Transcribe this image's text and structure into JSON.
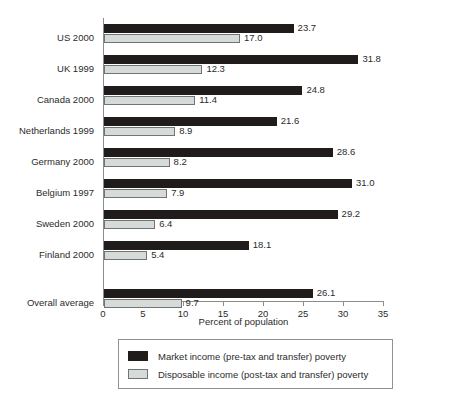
{
  "chart_data": {
    "type": "bar",
    "orientation": "horizontal",
    "title": "",
    "xlabel": "Percent of population",
    "ylabel": "",
    "xlim": [
      0,
      35
    ],
    "xticks": [
      0,
      5,
      10,
      15,
      20,
      25,
      30,
      35
    ],
    "xtick_labels": [
      "0",
      "5",
      "10",
      "15",
      "20",
      "25",
      "30",
      "35"
    ],
    "grid": false,
    "legend_position": "bottom",
    "categories": [
      "US 2000",
      "UK 1999",
      "Canada 2000",
      "Netherlands 1999",
      "Germany 2000",
      "Belgium 1997",
      "Sweden 2000",
      "Finland 2000",
      "Overall average"
    ],
    "series": [
      {
        "name": "Market income (pre-tax and transfer) poverty",
        "color": "#201c1b",
        "values": [
          23.7,
          31.8,
          24.8,
          21.6,
          28.6,
          31.0,
          29.2,
          18.1,
          26.1
        ],
        "labels": [
          "23.7",
          "31.8",
          "24.8",
          "21.6",
          "28.6",
          "31.0",
          "29.2",
          "18.1",
          "26.1"
        ]
      },
      {
        "name": "Disposable income (post-tax and transfer) poverty",
        "color": "#d6dad9",
        "values": [
          17.0,
          12.3,
          11.4,
          8.9,
          8.2,
          7.9,
          6.4,
          5.4,
          9.7
        ],
        "labels": [
          "17.0",
          "12.3",
          "11.4",
          "8.9",
          "8.2",
          "7.9",
          "6.4",
          "5.4",
          "9.7"
        ]
      }
    ]
  },
  "axis": {
    "x_title": "Percent of population"
  },
  "legend": {
    "items": [
      {
        "label": "Market income (pre-tax and transfer) poverty",
        "swatch": "market"
      },
      {
        "label": "Disposable income (post-tax and transfer) poverty",
        "swatch": "disposable"
      }
    ]
  }
}
